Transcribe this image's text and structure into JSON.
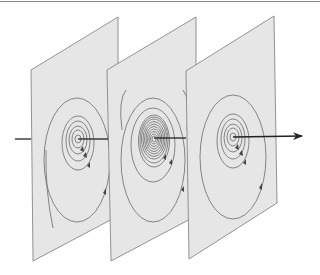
{
  "diagram": {
    "colors": {
      "plane_fill": "#e6e6e6",
      "plane_stroke": "#7a7a7a",
      "ring_stroke": "#6b6b6b",
      "axis": "#222222",
      "top_rule": "#8a8a8a"
    },
    "planes": [
      {
        "id": "plane-1",
        "center": [
          78,
          139
        ],
        "ring_count": 7,
        "density": "sparse"
      },
      {
        "id": "plane-2",
        "center": [
          154,
          139
        ],
        "ring_count": 14,
        "density": "dense"
      },
      {
        "id": "plane-3",
        "center": [
          233,
          137
        ],
        "ring_count": 7,
        "density": "sparse"
      }
    ],
    "axis": {
      "direction": "left-to-right",
      "arrowhead": "right"
    }
  }
}
